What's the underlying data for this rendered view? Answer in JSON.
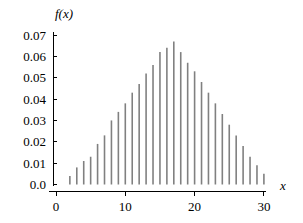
{
  "chart_data": {
    "type": "bar",
    "title": "",
    "subtitle": "",
    "xlabel": "x",
    "ylabel": "f(x)",
    "x": [
      2,
      3,
      4,
      5,
      6,
      7,
      8,
      9,
      10,
      11,
      12,
      13,
      14,
      15,
      16,
      17,
      18,
      19,
      20,
      21,
      22,
      23,
      24,
      25,
      26,
      27,
      28,
      29,
      30
    ],
    "values": [
      0.004,
      0.008,
      0.011,
      0.013,
      0.019,
      0.023,
      0.03,
      0.034,
      0.038,
      0.043,
      0.047,
      0.052,
      0.056,
      0.062,
      0.064,
      0.067,
      0.062,
      0.057,
      0.053,
      0.048,
      0.043,
      0.038,
      0.033,
      0.028,
      0.023,
      0.018,
      0.013,
      0.009,
      0.005
    ],
    "categories": [
      "2",
      "3",
      "4",
      "5",
      "6",
      "7",
      "8",
      "9",
      "10",
      "11",
      "12",
      "13",
      "14",
      "15",
      "16",
      "17",
      "18",
      "19",
      "20",
      "21",
      "22",
      "23",
      "24",
      "25",
      "26",
      "27",
      "28",
      "29",
      "30"
    ],
    "xlim": [
      0,
      31
    ],
    "ylim": [
      0.0,
      0.07
    ],
    "xticks": [
      0,
      10,
      20,
      30
    ],
    "xticklabels": [
      "0",
      "10",
      "20",
      "30"
    ],
    "yticks": [
      0.0,
      0.01,
      0.02,
      0.03,
      0.04,
      0.05,
      0.06,
      0.07
    ],
    "yticklabels": [
      "0.0",
      "0.01",
      "0.02",
      "0.03",
      "0.04",
      "0.05",
      "0.06",
      "0.07"
    ],
    "grid": false,
    "legend": null,
    "legend_position": "none",
    "bar_color": "#808080",
    "axis_color": "#000000",
    "background_color": "#ffffff"
  }
}
